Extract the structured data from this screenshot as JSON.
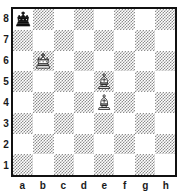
{
  "board": {
    "type": "chess-diagram",
    "orientation": "white-bottom",
    "files": [
      "a",
      "b",
      "c",
      "d",
      "e",
      "f",
      "g",
      "h"
    ],
    "ranks": [
      "8",
      "7",
      "6",
      "5",
      "4",
      "3",
      "2",
      "1"
    ],
    "light_square_color": "#ffffff",
    "dark_square_color": "#8d8d8d",
    "border_color": "#111111",
    "label_color": "#1a1a1a",
    "pieces": [
      {
        "square": "a8",
        "piece": "king",
        "color": "black",
        "icon": "black-king-icon",
        "file": 0,
        "rank": 0
      },
      {
        "square": "b6",
        "piece": "king",
        "color": "white",
        "icon": "white-king-icon",
        "file": 1,
        "rank": 2
      },
      {
        "square": "e5",
        "piece": "bishop",
        "color": "white",
        "icon": "white-bishop-icon",
        "file": 4,
        "rank": 3
      },
      {
        "square": "e4",
        "piece": "bishop",
        "color": "white",
        "icon": "white-bishop-icon",
        "file": 4,
        "rank": 4
      }
    ],
    "fen": "k7/8/1K6/4B3/4B3/8/8/8"
  }
}
